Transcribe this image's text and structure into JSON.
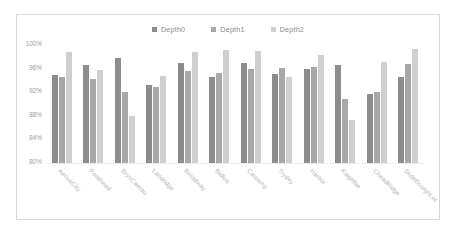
{
  "chart_data": {
    "type": "bar",
    "title": "",
    "xlabel": "",
    "ylabel": "",
    "ylim": [
      80,
      100
    ],
    "ytick_labels": [
      "100%",
      "96%",
      "92%",
      "88%",
      "84%",
      "80%"
    ],
    "ytick_values": [
      100,
      96,
      92,
      88,
      84,
      80
    ],
    "grid": false,
    "legend_position": "top-center",
    "categories": [
      "AeriusCity",
      "Polsthead",
      "BrynCaerau",
      "Landridge",
      "Broadway",
      "Bidloa",
      "Caiswmp",
      "Trydey",
      "Harbor",
      "Kaighfae",
      "CheadRidge",
      "SkdeBourghLot"
    ],
    "series": [
      {
        "name": "Depth0",
        "color": "#8c8c8c",
        "values": [
          95.0,
          96.6,
          97.8,
          93.2,
          97.0,
          94.6,
          96.9,
          95.1,
          95.9,
          96.6,
          91.7,
          94.5
        ]
      },
      {
        "name": "Depth1",
        "color": "#a8a8a8",
        "values": [
          94.5,
          94.3,
          92.0,
          92.9,
          95.6,
          95.2,
          96.0,
          96.1,
          96.2,
          90.9,
          92.0,
          96.8
        ]
      },
      {
        "name": "Depth2",
        "color": "#cfcfcf",
        "values": [
          98.8,
          95.7,
          88.0,
          94.8,
          98.8,
          99.2,
          99.0,
          94.6,
          98.3,
          87.3,
          97.1,
          99.3
        ]
      }
    ]
  },
  "legend": {
    "items": [
      {
        "label": "Depth0",
        "color": "#8c8c8c"
      },
      {
        "label": "Depth1",
        "color": "#a8a8a8"
      },
      {
        "label": "Depth2",
        "color": "#cfcfcf"
      }
    ]
  }
}
